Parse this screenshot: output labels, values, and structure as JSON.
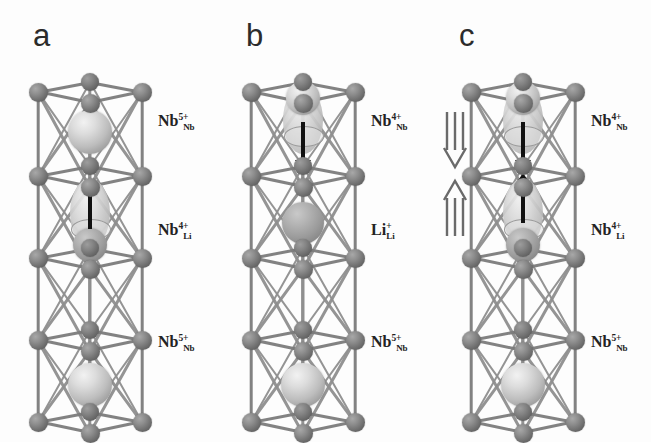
{
  "figure": {
    "caption_type": "crystal-structure-panels",
    "background_color": "#fdfdfd",
    "panels": [
      {
        "letter": "a",
        "labels": [
          {
            "symbol": "Nb",
            "charge": "5+",
            "site": "Nb"
          },
          {
            "symbol": "Nb",
            "charge": "4+",
            "site": "Li"
          },
          {
            "symbol": "Nb",
            "charge": "5+",
            "site": "Nb"
          }
        ],
        "arrows": [
          {
            "kind": "displacement",
            "direction": "up",
            "position": "middle"
          }
        ],
        "hollow_arrows": []
      },
      {
        "letter": "b",
        "labels": [
          {
            "symbol": "Nb",
            "charge": "4+",
            "site": "Nb"
          },
          {
            "symbol": "Li",
            "charge": "+",
            "site": "Li"
          },
          {
            "symbol": "Nb",
            "charge": "5+",
            "site": "Nb"
          }
        ],
        "arrows": [
          {
            "kind": "displacement",
            "direction": "down",
            "position": "top"
          }
        ],
        "hollow_arrows": []
      },
      {
        "letter": "c",
        "labels": [
          {
            "symbol": "Nb",
            "charge": "4+",
            "site": "Nb"
          },
          {
            "symbol": "Nb",
            "charge": "4+",
            "site": "Li"
          },
          {
            "symbol": "Nb",
            "charge": "5+",
            "site": "Nb"
          }
        ],
        "arrows": [
          {
            "kind": "displacement",
            "direction": "down",
            "position": "top"
          },
          {
            "kind": "displacement",
            "direction": "up",
            "position": "middle"
          }
        ],
        "hollow_arrows": [
          {
            "direction": "down",
            "position": "upper-left"
          },
          {
            "direction": "up",
            "position": "lower-left"
          }
        ]
      }
    ],
    "colors": {
      "framework_atom": "#6d6d6d",
      "cation_light": "#dcdcdc",
      "cation_mid": "#b2b2b2",
      "bond": "#7b7b7b",
      "arrow_black": "#111111",
      "hollow_arrow_outline": "#6a6a6a",
      "label_text": "#232323",
      "panel_letter": "#2b2b2b"
    }
  }
}
